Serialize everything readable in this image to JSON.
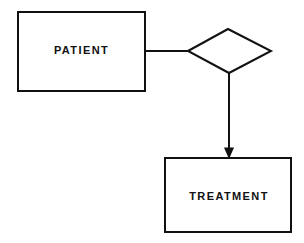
{
  "diagram": {
    "type": "entity-relationship-diagram",
    "background_color": "#ffffff",
    "stroke_color": "#111111",
    "title": "",
    "entities": [
      {
        "id": "patient",
        "label": "PATIENT",
        "shape": "rectangle",
        "x": 18,
        "y": 12,
        "width": 127,
        "height": 79
      },
      {
        "id": "treatment",
        "label": "TREATMENT",
        "shape": "rectangle",
        "x": 165,
        "y": 158,
        "width": 126,
        "height": 74
      }
    ],
    "relationships": [
      {
        "id": "relationship-diamond",
        "label": "",
        "shape": "diamond",
        "left_x": 188,
        "left_y": 51,
        "top_x": 228,
        "top_y": 29,
        "right_x": 271,
        "right_y": 51,
        "bottom_x": 229,
        "bottom_y": 73
      }
    ],
    "connectors": [
      {
        "id": "patient-to-relationship",
        "from": "patient",
        "to": "relationship-diamond",
        "arrow": false,
        "points": "145,51 188,51"
      },
      {
        "id": "relationship-to-treatment",
        "from": "relationship-diamond",
        "to": "treatment",
        "arrow": true,
        "points": "229,73 229,152",
        "arrowhead": "229,159 224.5,148 233.5,148"
      }
    ]
  }
}
